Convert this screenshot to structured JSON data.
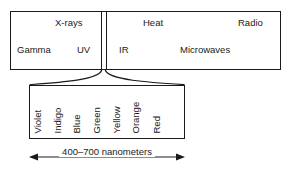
{
  "diagram": {
    "ink_color": "#1a1a1a",
    "background_color": "#ffffff"
  },
  "spectrum": {
    "bands": [
      {
        "label": "X-rays",
        "row": "top",
        "side": "left"
      },
      {
        "label": "Gamma",
        "row": "bottom",
        "side": "left"
      },
      {
        "label": "UV",
        "row": "bottom",
        "side": "left"
      },
      {
        "label": "Heat",
        "row": "top",
        "side": "right"
      },
      {
        "label": "Radio",
        "row": "top",
        "side": "right"
      },
      {
        "label": "IR",
        "row": "bottom",
        "side": "right"
      },
      {
        "label": "Microwaves",
        "row": "bottom",
        "side": "right"
      }
    ]
  },
  "visible_light": {
    "colors": [
      {
        "name": "Violet"
      },
      {
        "name": "Indigo"
      },
      {
        "name": "Blue"
      },
      {
        "name": "Green"
      },
      {
        "name": "Yellow"
      },
      {
        "name": "Orange"
      },
      {
        "name": "Red"
      }
    ],
    "range_caption": "400–700 nanometers"
  }
}
